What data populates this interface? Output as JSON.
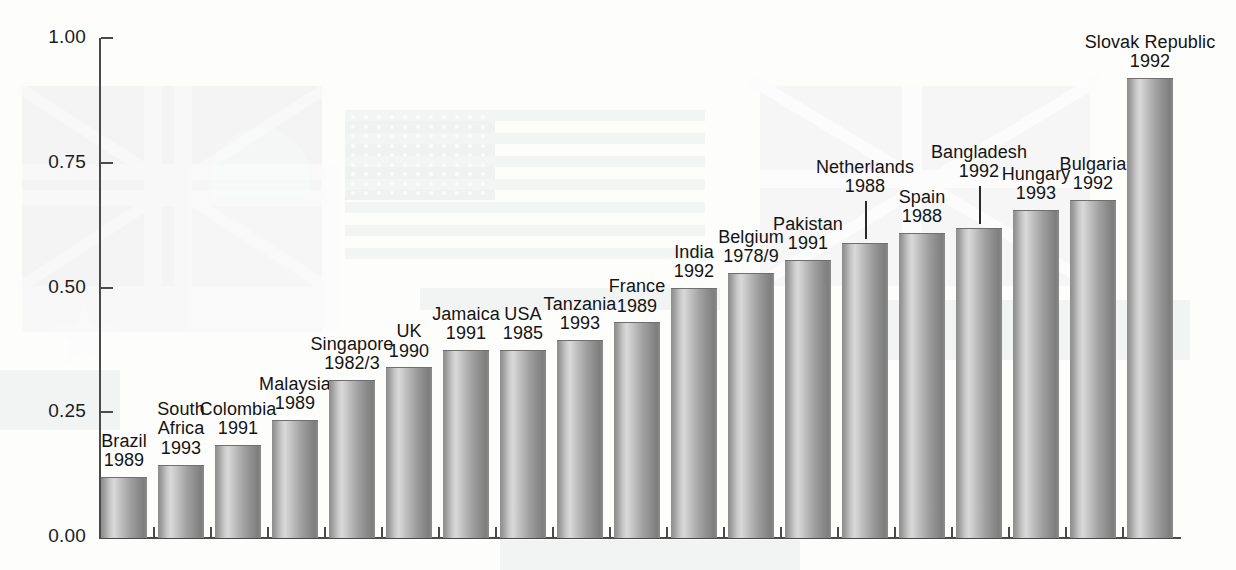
{
  "chart": {
    "type": "bar",
    "title": "",
    "xlabel": "",
    "ylabel": "",
    "ylim": [
      0,
      1.0
    ],
    "grid": false,
    "legend": "none",
    "y_ticks": [
      "0.00",
      "0.25",
      "0.50",
      "0.75",
      "1.00"
    ],
    "y_tick_values": [
      0.0,
      0.25,
      0.5,
      0.75,
      1.0
    ]
  },
  "chart_data": {
    "type": "bar",
    "title": "",
    "xlabel": "",
    "ylabel": "",
    "ylim": [
      0,
      1.0
    ],
    "grid": false,
    "legend": "none",
    "ticklabels": [
      "0.00",
      "0.25",
      "0.50",
      "0.75",
      "1.00"
    ],
    "categories": [
      "Brazil",
      "South Africa",
      "Colombia",
      "Malaysia",
      "Singapore",
      "UK",
      "Jamaica",
      "USA",
      "Tanzania",
      "France",
      "India",
      "Belgium",
      "Pakistan",
      "Netherlands",
      "Spain",
      "Bangladesh",
      "Hungary",
      "Bulgaria",
      "Slovak Republic"
    ],
    "years": [
      "1989",
      "1993",
      "1991",
      "1989",
      "1982/3",
      "1990",
      "1991",
      "1985",
      "1993",
      "1989",
      "1992",
      "1978/9",
      "1991",
      "1988",
      "1988",
      "1992",
      "1993",
      "1992",
      "1992"
    ],
    "values": [
      0.12,
      0.145,
      0.185,
      0.235,
      0.315,
      0.34,
      0.375,
      0.375,
      0.395,
      0.43,
      0.5,
      0.53,
      0.555,
      0.59,
      0.61,
      0.62,
      0.655,
      0.675,
      0.92
    ]
  },
  "bars": [
    {
      "name": "Brazil",
      "year": "1989",
      "value": 0.12,
      "leader": false
    },
    {
      "name": "South Africa",
      "year": "1993",
      "value": 0.145,
      "leader": false
    },
    {
      "name": "Colombia",
      "year": "1991",
      "value": 0.185,
      "leader": false
    },
    {
      "name": "Malaysia",
      "year": "1989",
      "value": 0.235,
      "leader": false
    },
    {
      "name": "Singapore",
      "year": "1982/3",
      "value": 0.315,
      "leader": false
    },
    {
      "name": "UK",
      "year": "1990",
      "value": 0.34,
      "leader": false
    },
    {
      "name": "Jamaica",
      "year": "1991",
      "value": 0.375,
      "leader": false
    },
    {
      "name": "USA",
      "year": "1985",
      "value": 0.375,
      "leader": false
    },
    {
      "name": "Tanzania",
      "year": "1993",
      "value": 0.395,
      "leader": false
    },
    {
      "name": "France",
      "year": "1989",
      "value": 0.43,
      "leader": false
    },
    {
      "name": "India",
      "year": "1992",
      "value": 0.5,
      "leader": false
    },
    {
      "name": "Belgium",
      "year": "1978/9",
      "value": 0.53,
      "leader": false
    },
    {
      "name": "Pakistan",
      "year": "1991",
      "value": 0.555,
      "leader": false
    },
    {
      "name": "Netherlands",
      "year": "1988",
      "value": 0.59,
      "leader": true
    },
    {
      "name": "Spain",
      "year": "1988",
      "value": 0.61,
      "leader": false
    },
    {
      "name": "Bangladesh",
      "year": "1992",
      "value": 0.62,
      "leader": true
    },
    {
      "name": "Hungary",
      "year": "1993",
      "value": 0.655,
      "leader": false
    },
    {
      "name": "Bulgaria",
      "year": "1992",
      "value": 0.675,
      "leader": false
    },
    {
      "name": "Slovak Republic",
      "year": "1992",
      "value": 0.92,
      "leader": false
    }
  ]
}
